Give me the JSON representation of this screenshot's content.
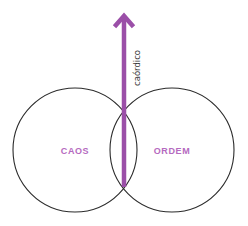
{
  "diagram": {
    "axis": {
      "label": "caórdico",
      "direction": "up"
    },
    "circles": [
      {
        "id": "left",
        "label": "CAOS"
      },
      {
        "id": "right",
        "label": "ORDEM"
      }
    ],
    "colors": {
      "arrow": "#9b4fa8",
      "label": "#b56ac0",
      "circle_stroke": "#2b2b2b",
      "axis_label": "#3a3a3a",
      "background": "#ffffff"
    }
  }
}
